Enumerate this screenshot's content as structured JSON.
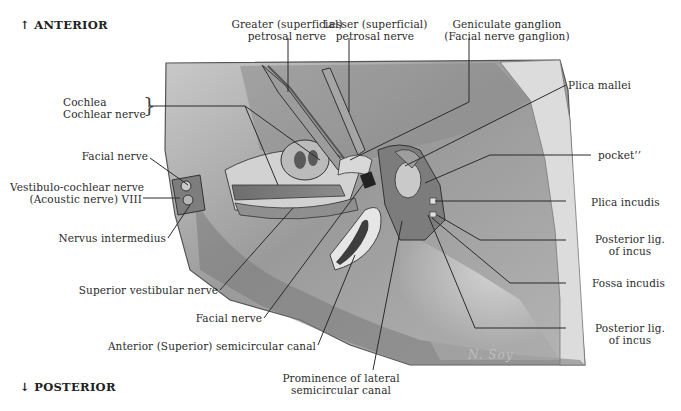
{
  "orientation": {
    "top": {
      "arrow": "↑",
      "label": "ANTERIOR"
    },
    "bottom": {
      "arrow": "↓",
      "label": "POSTERIOR"
    }
  },
  "signature": "N. Soy",
  "labels": {
    "greater_petrosal": {
      "line1": "Greater (superficial)",
      "line2": "petrosal nerve"
    },
    "lesser_petrosal": {
      "line1": "Lesser (superficial)",
      "line2": "petrosal nerve"
    },
    "geniculate": {
      "line1": "Geniculate ganglion",
      "line2": "(Facial nerve ganglion)"
    },
    "cochlea": {
      "line1": "Cochlea",
      "line2": "Cochlear nerve"
    },
    "facial_nerve_upper": "Facial nerve",
    "vestibulocochlear": {
      "line1": "Vestibulo-cochlear nerve",
      "line2": "(Acoustic nerve) VIII"
    },
    "nervus_intermedius": "Nervus intermedius",
    "superior_vestibular": "Superior vestibular nerve",
    "facial_nerve_lower": "Facial nerve",
    "anterior_canal": "Anterior (Superior) semicircular canal",
    "lateral_canal": {
      "line1": "Prominence of lateral",
      "line2": "semicircular canal"
    },
    "plica_mallei": "Plica mallei",
    "pocket": "pocket’’",
    "plica_incudis": "Plica incudis",
    "posterior_lig_1": {
      "line1": "Posterior lig.",
      "line2": "of incus"
    },
    "fossa_incudis": "Fossa incudis",
    "posterior_lig_2": {
      "line1": "Posterior lig.",
      "line2": "of incus"
    }
  }
}
